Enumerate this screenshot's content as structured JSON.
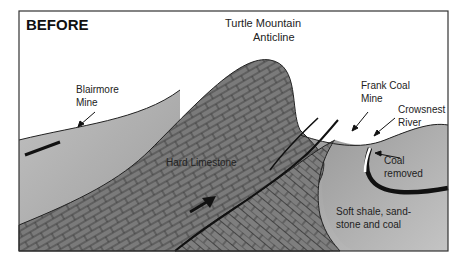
{
  "title": "BEFORE",
  "labels": {
    "anticline_line1": "Turtle Mountain",
    "anticline_line2": "Anticline",
    "blairmore_line1": "Blairmore",
    "blairmore_line2": "Mine",
    "frank_line1": "Frank Coal",
    "frank_line2": "Mine",
    "river_line1": "Crowsnest",
    "river_line2": "River",
    "coal_line1": "Coal",
    "coal_line2": "removed",
    "limestone": "Hard Limestone",
    "shale_line1": "Soft shale, sand-",
    "shale_line2": "stone and coal"
  },
  "colors": {
    "sky": "#ffffff",
    "limestone": "#7a7a7a",
    "shale": "#a8a8a8",
    "border": "#333333"
  }
}
